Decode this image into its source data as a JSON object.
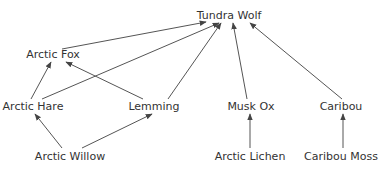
{
  "diagram": {
    "colors": {
      "text": "#333333",
      "edge": "#555555",
      "background": "#ffffff"
    },
    "nodes": [
      {
        "id": "tundra_wolf",
        "label": "Tundra Wolf",
        "x": 229,
        "y": 9
      },
      {
        "id": "arctic_fox",
        "label": "Arctic Fox",
        "x": 53,
        "y": 48
      },
      {
        "id": "arctic_hare",
        "label": "Arctic Hare",
        "x": 33,
        "y": 100
      },
      {
        "id": "lemming",
        "label": "Lemming",
        "x": 154,
        "y": 100
      },
      {
        "id": "musk_ox",
        "label": "Musk Ox",
        "x": 251,
        "y": 100
      },
      {
        "id": "caribou",
        "label": "Caribou",
        "x": 341,
        "y": 100
      },
      {
        "id": "arctic_willow",
        "label": "Arctic Willow",
        "x": 70,
        "y": 150
      },
      {
        "id": "arctic_lichen",
        "label": "Arctic Lichen",
        "x": 250,
        "y": 150
      },
      {
        "id": "caribou_moss",
        "label": "Caribou Moss",
        "x": 341,
        "y": 150
      }
    ],
    "edges": [
      {
        "from": "arctic_fox",
        "to": "tundra_wolf",
        "x1": 62,
        "y1": 49,
        "x2": 206,
        "y2": 22
      },
      {
        "from": "arctic_hare",
        "to": "tundra_wolf",
        "x1": 42,
        "y1": 99,
        "x2": 219,
        "y2": 23
      },
      {
        "from": "lemming",
        "to": "tundra_wolf",
        "x1": 168,
        "y1": 99,
        "x2": 221,
        "y2": 23
      },
      {
        "from": "musk_ox",
        "to": "tundra_wolf",
        "x1": 247,
        "y1": 99,
        "x2": 233,
        "y2": 23
      },
      {
        "from": "caribou",
        "to": "tundra_wolf",
        "x1": 342,
        "y1": 99,
        "x2": 250,
        "y2": 23
      },
      {
        "from": "arctic_hare",
        "to": "arctic_fox",
        "x1": 31,
        "y1": 99,
        "x2": 51,
        "y2": 62
      },
      {
        "from": "lemming",
        "to": "arctic_fox",
        "x1": 143,
        "y1": 99,
        "x2": 66,
        "y2": 62
      },
      {
        "from": "arctic_willow",
        "to": "arctic_hare",
        "x1": 62,
        "y1": 148,
        "x2": 35,
        "y2": 114
      },
      {
        "from": "arctic_willow",
        "to": "lemming",
        "x1": 82,
        "y1": 148,
        "x2": 152,
        "y2": 114
      },
      {
        "from": "arctic_lichen",
        "to": "musk_ox",
        "x1": 250,
        "y1": 148,
        "x2": 250,
        "y2": 114
      },
      {
        "from": "caribou_moss",
        "to": "caribou",
        "x1": 343,
        "y1": 148,
        "x2": 343,
        "y2": 114
      }
    ]
  }
}
